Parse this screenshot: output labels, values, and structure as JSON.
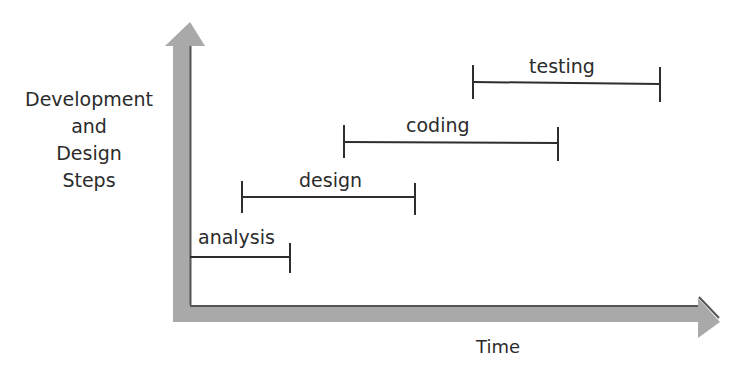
{
  "diagram": {
    "title": "",
    "y_axis_label_lines": [
      "Development",
      "and",
      "Design",
      "Steps"
    ],
    "x_axis_label": "Time",
    "phases": [
      {
        "label": "analysis",
        "start_x": 190,
        "end_x": 290,
        "y": 257
      },
      {
        "label": "design",
        "start_x": 242,
        "end_x": 415,
        "y": 197
      },
      {
        "label": "coding",
        "start_x": 344,
        "end_x": 558,
        "y": 142
      },
      {
        "label": "testing",
        "start_x": 473,
        "end_x": 660,
        "y": 83
      }
    ],
    "colors": {
      "axis_fill": "#a9a9a9",
      "axis_edge": "#555555",
      "bar": "#2e2e2e",
      "text": "#2b2b2b"
    }
  }
}
